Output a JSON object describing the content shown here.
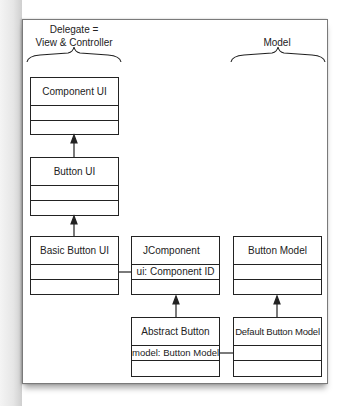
{
  "groups": {
    "delegate": {
      "line1": "Delegate =",
      "line2": "View & Controller"
    },
    "model": {
      "label": "Model"
    }
  },
  "classes": [
    {
      "id": "component-ui",
      "name": "Component UI",
      "attributes": [
        "",
        ""
      ]
    },
    {
      "id": "button-ui",
      "name": "Button UI",
      "attributes": [
        "",
        ""
      ]
    },
    {
      "id": "basic-button-ui",
      "name": "Basic Button UI",
      "attributes": [
        "",
        ""
      ]
    },
    {
      "id": "jcomponent",
      "name": "JComponent",
      "attributes": [
        "ui: Component ID",
        ""
      ]
    },
    {
      "id": "button-model",
      "name": "Button Model",
      "attributes": [
        "",
        ""
      ]
    },
    {
      "id": "abstract-button",
      "name": "Abstract Button",
      "attributes": [
        "model: Button Model",
        ""
      ]
    },
    {
      "id": "default-button-model",
      "name": "Default Button Model",
      "attributes": [
        "",
        ""
      ]
    }
  ],
  "relations": [
    {
      "type": "inheritance",
      "from": "Button UI",
      "to": "Component UI"
    },
    {
      "type": "inheritance",
      "from": "Basic Button UI",
      "to": "Button UI"
    },
    {
      "type": "inheritance",
      "from": "Abstract Button",
      "to": "JComponent"
    },
    {
      "type": "inheritance",
      "from": "Default Button Model",
      "to": "Button Model"
    },
    {
      "type": "association",
      "from": "JComponent",
      "to": "Basic Button UI"
    },
    {
      "type": "association",
      "from": "Abstract Button",
      "to": "Default Button Model"
    }
  ],
  "colors": {
    "line": "#222222",
    "frame": "#7a7a7a",
    "background": "#ffffff"
  }
}
